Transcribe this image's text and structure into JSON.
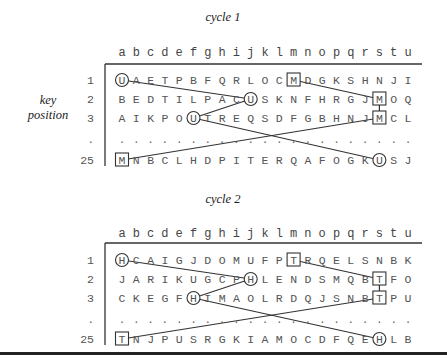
{
  "side_label": {
    "line1": "key",
    "line2": "position"
  },
  "columns": [
    "a",
    "b",
    "c",
    "d",
    "e",
    "f",
    "g",
    "h",
    "i",
    "j",
    "k",
    "l",
    "m",
    "n",
    "o",
    "p",
    "q",
    "r",
    "s",
    "t",
    "u"
  ],
  "cycles": [
    {
      "title": "cycle 1",
      "rows": [
        {
          "label": "1",
          "letters": "UAETPBFQRLOCMDGKSHNJI"
        },
        {
          "label": "2",
          "letters": "BEDTILPACUSKNFHRGJMOQ"
        },
        {
          "label": "3",
          "letters": "AIKPOUTREQSDFGBHNJMCL"
        },
        {
          "label": ".",
          "letters": "....................."
        },
        {
          "label": "25",
          "letters": "MNBCLHDPITERQAFOGKUSJ"
        }
      ],
      "circled_letter": "U",
      "boxed_letter": "M",
      "circles": [
        {
          "row": 0,
          "col": 0
        },
        {
          "row": 1,
          "col": 9
        },
        {
          "row": 2,
          "col": 5
        },
        {
          "row": 4,
          "col": 18
        }
      ],
      "boxes": [
        {
          "row": 0,
          "col": 12
        },
        {
          "row": 1,
          "col": 18
        },
        {
          "row": 2,
          "col": 18
        },
        {
          "row": 4,
          "col": 0
        }
      ],
      "links": [
        {
          "from": [
            0,
            0
          ],
          "to": [
            1,
            9
          ]
        },
        {
          "from": [
            1,
            9
          ],
          "to": [
            2,
            5
          ]
        },
        {
          "from": [
            2,
            5
          ],
          "to": [
            4,
            18
          ]
        },
        {
          "from": [
            0,
            12
          ],
          "to": [
            1,
            18
          ]
        },
        {
          "from": [
            1,
            18
          ],
          "to": [
            2,
            18
          ]
        },
        {
          "from": [
            2,
            18
          ],
          "to": [
            4,
            0
          ]
        }
      ]
    },
    {
      "title": "cycle 2",
      "rows": [
        {
          "label": "1",
          "letters": "HCAIGJDOMUFPTRQELSNBK"
        },
        {
          "label": "2",
          "letters": "JARIKUGCPHLENDSMQBTFO"
        },
        {
          "label": "3",
          "letters": "CKEGFHIMAOLRDQJSNBTPU"
        },
        {
          "label": ".",
          "letters": "....................."
        },
        {
          "label": "25",
          "letters": "TNJPUSRGKIAMOCDFQEHLB"
        }
      ],
      "circled_letter": "H",
      "boxed_letter": "T",
      "circles": [
        {
          "row": 0,
          "col": 0
        },
        {
          "row": 1,
          "col": 9
        },
        {
          "row": 2,
          "col": 5
        },
        {
          "row": 4,
          "col": 18
        }
      ],
      "boxes": [
        {
          "row": 0,
          "col": 12
        },
        {
          "row": 1,
          "col": 18
        },
        {
          "row": 2,
          "col": 18
        },
        {
          "row": 4,
          "col": 0
        }
      ],
      "links": [
        {
          "from": [
            0,
            0
          ],
          "to": [
            1,
            9
          ]
        },
        {
          "from": [
            1,
            9
          ],
          "to": [
            2,
            5
          ]
        },
        {
          "from": [
            2,
            5
          ],
          "to": [
            4,
            18
          ]
        },
        {
          "from": [
            0,
            12
          ],
          "to": [
            1,
            18
          ]
        },
        {
          "from": [
            1,
            18
          ],
          "to": [
            2,
            18
          ]
        },
        {
          "from": [
            2,
            18
          ],
          "to": [
            4,
            0
          ]
        }
      ]
    }
  ]
}
